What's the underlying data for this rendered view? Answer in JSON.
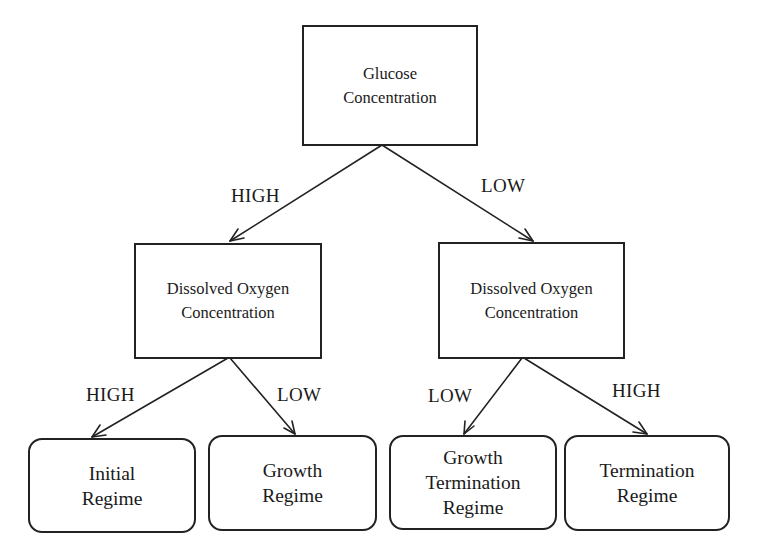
{
  "diagram": {
    "type": "decision-tree",
    "colors": {
      "stroke": "#222222",
      "text": "#1a1a1a",
      "background": "#ffffff"
    },
    "nodes": {
      "root": {
        "lines": [
          "Glucose",
          "Concentration"
        ],
        "shape": "rectangle"
      },
      "oxygen_left": {
        "lines": [
          "Dissolved Oxygen",
          "Concentration"
        ],
        "shape": "rectangle"
      },
      "oxygen_right": {
        "lines": [
          "Dissolved Oxygen",
          "Concentration"
        ],
        "shape": "rectangle"
      },
      "initial_regime": {
        "lines": [
          "Initial",
          "Regime"
        ],
        "shape": "rounded-rectangle"
      },
      "growth_regime": {
        "lines": [
          "Growth",
          "Regime"
        ],
        "shape": "rounded-rectangle"
      },
      "growth_termination_regime": {
        "lines": [
          "Growth",
          "Termination",
          "Regime"
        ],
        "shape": "rounded-rectangle"
      },
      "termination_regime": {
        "lines": [
          "Termination",
          "Regime"
        ],
        "shape": "rounded-rectangle"
      }
    },
    "edges": [
      {
        "from": "root",
        "to": "oxygen_left",
        "label": "HIGH"
      },
      {
        "from": "root",
        "to": "oxygen_right",
        "label": "LOW"
      },
      {
        "from": "oxygen_left",
        "to": "initial_regime",
        "label": "HIGH"
      },
      {
        "from": "oxygen_left",
        "to": "growth_regime",
        "label": "LOW"
      },
      {
        "from": "oxygen_right",
        "to": "growth_termination_regime",
        "label": "LOW"
      },
      {
        "from": "oxygen_right",
        "to": "termination_regime",
        "label": "HIGH"
      }
    ]
  }
}
